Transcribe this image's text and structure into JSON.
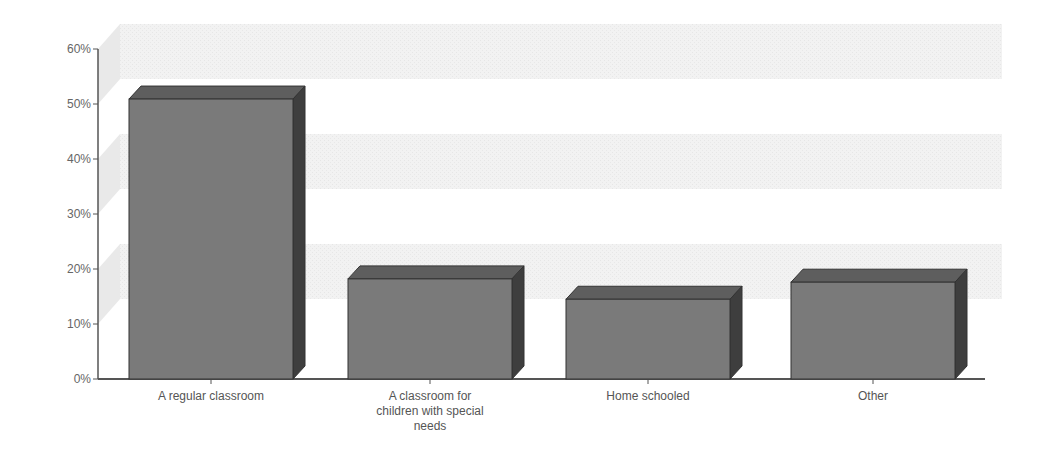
{
  "chart_data": {
    "type": "bar",
    "title": "",
    "xlabel": "",
    "ylabel": "",
    "categories": [
      "A regular classroom",
      "A classroom for children with special needs",
      "Home schooled",
      "Other"
    ],
    "category_lines": [
      [
        "A regular classroom"
      ],
      [
        "A classroom for",
        "children with special",
        "needs"
      ],
      [
        "Home schooled"
      ],
      [
        "Other"
      ]
    ],
    "values": [
      50.9,
      18.2,
      14.5,
      17.6
    ],
    "ylim": [
      0,
      60
    ],
    "yticks": [
      0,
      10,
      20,
      30,
      40,
      50,
      60
    ],
    "ytick_labels": [
      "0%",
      "10%",
      "20%",
      "30%",
      "40%",
      "50%",
      "60%"
    ],
    "grid": "alternating bands",
    "legend": "none",
    "style": "3d",
    "colors": {
      "front": "#7a7a7a",
      "top": "#5e5e5e",
      "side": "#3e3e3e",
      "band": "#efefef",
      "axis": "#555555"
    }
  }
}
